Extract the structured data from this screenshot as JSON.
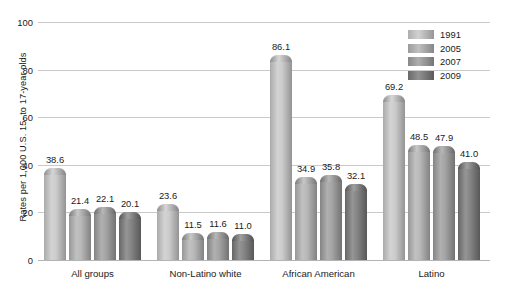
{
  "chart_data": {
    "type": "bar",
    "title": "",
    "xlabel": "",
    "ylabel": "Rates per 1,000 U.S. 15- to 17-year olds",
    "ylim": [
      0,
      100
    ],
    "yticks": [
      0,
      20,
      40,
      60,
      80,
      100
    ],
    "ytick_labels": [
      "0",
      "20",
      "40",
      "60",
      "80",
      "100"
    ],
    "grid": true,
    "legend_position": "top-right",
    "categories": [
      "All groups",
      "Non-Latino white",
      "African American",
      "Latino"
    ],
    "series": [
      {
        "name": "1991",
        "color": "#c6c6c6",
        "values": [
          38.6,
          23.6,
          86.1,
          69.2
        ]
      },
      {
        "name": "2005",
        "color": "#b0b0b0",
        "values": [
          21.4,
          11.5,
          34.9,
          48.5
        ]
      },
      {
        "name": "2007",
        "color": "#9a9a9a",
        "values": [
          22.1,
          11.6,
          35.8,
          47.9
        ]
      },
      {
        "name": "2009",
        "color": "#777777",
        "values": [
          20.1,
          11.0,
          32.1,
          41.0
        ]
      }
    ],
    "value_labels": [
      [
        "38.6",
        "21.4",
        "22.1",
        "20.1"
      ],
      [
        "23.6",
        "11.5",
        "11.6",
        "11.0"
      ],
      [
        "86.1",
        "34.9",
        "35.8",
        "32.1"
      ],
      [
        "69.2",
        "48.5",
        "47.9",
        "41.0"
      ]
    ]
  },
  "colors": {
    "background": "#ffffff",
    "gridline": "#c9c9c9",
    "axis": "#b4b4b4",
    "text": "#1a1a1a"
  }
}
